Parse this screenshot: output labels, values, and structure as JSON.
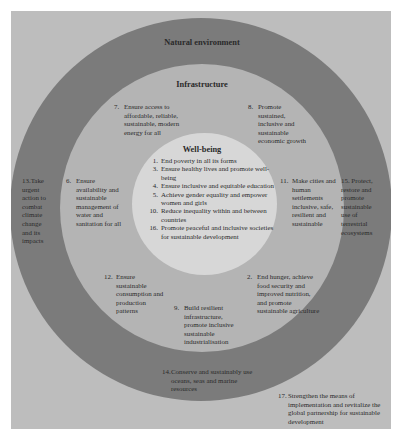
{
  "diagram": {
    "rings": {
      "outer": {
        "title": "Natural environment",
        "color": "#7b7b7b"
      },
      "middle": {
        "title": "Infrastructure",
        "color": "#b4b4b4"
      },
      "inner": {
        "title": "Well-being",
        "color": "#d7d7d7"
      }
    },
    "background_color": "#bdbdbd",
    "wellbeing_goals": [
      {
        "num": "1.",
        "text": "End poverty in all its forms"
      },
      {
        "num": "3.",
        "text": "Ensure healthy lives and promote well-being"
      },
      {
        "num": "4.",
        "text": "Ensure inclusive and equitable education"
      },
      {
        "num": "5.",
        "text": "Achieve gender equality and empower women and girls"
      },
      {
        "num": "10.",
        "text": "Reduce inequality within and between countries"
      },
      {
        "num": "16.",
        "text": "Promote peaceful and inclusive societies for sustainable development"
      }
    ],
    "infrastructure_goals": {
      "g7": {
        "num": "7.",
        "text": "Ensure access to affordable, reliable, sustainable, modern energy for all"
      },
      "g8": {
        "num": "8.",
        "text": "Promote sustained, inclusive and sustainable economic growth"
      },
      "g6": {
        "num": "6.",
        "text": "Ensure availability and sustainable management of water and sanitation for all"
      },
      "g11": {
        "num": "11.",
        "text": "Make cities and human settlements inclusive, safe, resilient and sustainable"
      },
      "g12": {
        "num": "12.",
        "text": "Ensure sustainable consumption and production patterns"
      },
      "g2": {
        "num": "2.",
        "text": "End hunger, achieve food security and improved nutrition, and promote sustainable agriculture"
      },
      "g9": {
        "num": "9.",
        "text": "Build resilient infrastructure, promote inclusive sustainable industrialisation"
      }
    },
    "environment_goals": {
      "g13": {
        "num": "13.",
        "text": "Take urgent action to combat climate change and its impacts"
      },
      "g15": {
        "num": "15.",
        "text": "Protect, restore and promote sustainable use of terrestrial ecosystems"
      },
      "g14": {
        "num": "14.",
        "text": "Conserve and sustainably use oceans, seas and marine resources"
      }
    },
    "outside_goal": {
      "g17": {
        "num": "17.",
        "text": "Strengthen the means of implementation and revitalize the global partnership for sustainable development"
      }
    }
  }
}
